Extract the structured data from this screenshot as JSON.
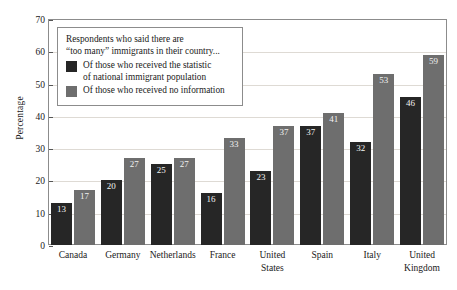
{
  "chart_data": {
    "type": "bar",
    "title": "",
    "xlabel": "",
    "ylabel": "Percentage",
    "ylim": [
      0,
      70
    ],
    "ytick_step": 10,
    "yticks": [
      0,
      10,
      20,
      30,
      40,
      50,
      60,
      70
    ],
    "grid": true,
    "legend_position": "top-left",
    "categories": [
      "Canada",
      "Germany",
      "Netherlands",
      "France",
      "United\nStates",
      "Spain",
      "Italy",
      "United\nKingdom"
    ],
    "series": [
      {
        "name": "Of those who received the statistic\nof national immigrant population",
        "color": "#262626",
        "values": [
          13,
          20,
          25,
          16,
          23,
          37,
          32,
          46
        ]
      },
      {
        "name": "Of those who received no information",
        "color": "#6e6e6e",
        "values": [
          17,
          27,
          27,
          33,
          37,
          41,
          53,
          59
        ]
      }
    ],
    "annotations": {
      "legend_header": "Respondents who said there are\n“too many” immigrants in their country..."
    }
  },
  "colors": {
    "series_dark": "#262626",
    "series_light": "#6e6e6e",
    "frame": "#8c8c8c",
    "gridline": "#dedad4",
    "value_label": "#f2f2f2",
    "background": "#ffffff"
  }
}
